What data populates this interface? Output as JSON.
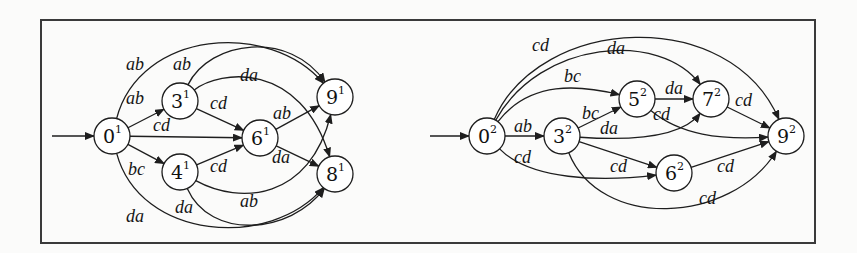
{
  "figure": {
    "frame": {
      "x": 41,
      "y": 20,
      "width": 774,
      "height": 223
    },
    "node_radius": 18,
    "colors": {
      "stroke": "#1e1e1e",
      "frame": "#3a3a3a",
      "background": "#fbfbfa"
    }
  },
  "automata": [
    {
      "id": "automaton-1",
      "initial": {
        "from": [
          52,
          136
        ],
        "to": "0^1"
      },
      "nodes": [
        {
          "id": "0^1",
          "base": "0",
          "sup": "1",
          "x": 112,
          "y": 136
        },
        {
          "id": "3^1",
          "base": "3",
          "sup": "1",
          "x": 180,
          "y": 101
        },
        {
          "id": "4^1",
          "base": "4",
          "sup": "1",
          "x": 180,
          "y": 172
        },
        {
          "id": "6^1",
          "base": "6",
          "sup": "1",
          "x": 260,
          "y": 138
        },
        {
          "id": "9^1",
          "base": "9",
          "sup": "1",
          "x": 335,
          "y": 97
        },
        {
          "id": "8^1",
          "base": "8",
          "sup": "1",
          "x": 335,
          "y": 174
        }
      ],
      "edges": [
        {
          "from": "0^1",
          "to": "9^1",
          "label": "ab",
          "c1": [
            140,
            30
          ],
          "c2": [
            270,
            20
          ],
          "lx": 126,
          "ly": 70
        },
        {
          "from": "0^1",
          "to": "3^1",
          "label": "ab",
          "lx": 126,
          "ly": 104
        },
        {
          "from": "0^1",
          "to": "6^1",
          "label": "cd",
          "lx": 153,
          "ly": 131
        },
        {
          "from": "0^1",
          "to": "4^1",
          "label": "bc",
          "lx": 128,
          "ly": 175
        },
        {
          "from": "0^1",
          "to": "8^1",
          "label": "da",
          "c1": [
            140,
            240
          ],
          "c2": [
            270,
            250
          ],
          "lx": 126,
          "ly": 222
        },
        {
          "from": "3^1",
          "to": "9^1",
          "label": "ab",
          "c1": [
            210,
            40
          ],
          "c2": [
            290,
            30
          ],
          "lx": 173,
          "ly": 70
        },
        {
          "from": "3^1",
          "to": "8^1",
          "label": "da",
          "c1": [
            220,
            70
          ],
          "c2": [
            300,
            60
          ],
          "lx": 240,
          "ly": 81
        },
        {
          "from": "3^1",
          "to": "6^1",
          "label": "cd",
          "lx": 210,
          "ly": 109
        },
        {
          "from": "4^1",
          "to": "6^1",
          "label": "cd",
          "lx": 210,
          "ly": 172
        },
        {
          "from": "4^1",
          "to": "9^1",
          "label": "ab",
          "c1": [
            240,
            205
          ],
          "c2": [
            310,
            200
          ],
          "lx": 240,
          "ly": 207
        },
        {
          "from": "4^1",
          "to": "8^1",
          "label": "da",
          "c1": [
            210,
            240
          ],
          "c2": [
            290,
            235
          ],
          "lx": 175,
          "ly": 213
        },
        {
          "from": "6^1",
          "to": "9^1",
          "label": "ab",
          "lx": 273,
          "ly": 119
        },
        {
          "from": "6^1",
          "to": "8^1",
          "label": "da",
          "lx": 272,
          "ly": 163
        }
      ]
    },
    {
      "id": "automaton-2",
      "initial": {
        "from": [
          430,
          136
        ],
        "to": "0^2"
      },
      "nodes": [
        {
          "id": "0^2",
          "base": "0",
          "sup": "2",
          "x": 487,
          "y": 136
        },
        {
          "id": "3^2",
          "base": "3",
          "sup": "2",
          "x": 562,
          "y": 136
        },
        {
          "id": "5^2",
          "base": "5",
          "sup": "2",
          "x": 637,
          "y": 99
        },
        {
          "id": "7^2",
          "base": "7",
          "sup": "2",
          "x": 711,
          "y": 99
        },
        {
          "id": "6^2",
          "base": "6",
          "sup": "2",
          "x": 674,
          "y": 173
        },
        {
          "id": "9^2",
          "base": "9",
          "sup": "2",
          "x": 786,
          "y": 136
        }
      ],
      "edges": [
        {
          "from": "0^2",
          "to": "9^2",
          "label": "cd",
          "c1": [
            540,
            15
          ],
          "c2": [
            730,
            5
          ],
          "lx": 532,
          "ly": 51
        },
        {
          "from": "0^2",
          "to": "7^2",
          "label": "da",
          "c1": [
            540,
            40
          ],
          "c2": [
            660,
            30
          ],
          "lx": 607,
          "ly": 54
        },
        {
          "from": "0^2",
          "to": "5^2",
          "label": "bc",
          "c1": [
            530,
            80
          ],
          "c2": [
            580,
            85
          ],
          "lx": 564,
          "ly": 82
        },
        {
          "from": "0^2",
          "to": "3^2",
          "label": "ab",
          "lx": 514,
          "ly": 132
        },
        {
          "from": "0^2",
          "to": "6^2",
          "label": "cd",
          "c1": [
            530,
            180
          ],
          "c2": [
            600,
            182
          ],
          "lx": 514,
          "ly": 163
        },
        {
          "from": "3^2",
          "to": "5^2",
          "label": "bc",
          "lx": 582,
          "ly": 119
        },
        {
          "from": "3^2",
          "to": "7^2",
          "label": "da",
          "c1": [
            620,
            140
          ],
          "c2": [
            680,
            140
          ],
          "lx": 600,
          "ly": 134
        },
        {
          "from": "3^2",
          "to": "6^2",
          "label": "cd",
          "lx": 610,
          "ly": 172
        },
        {
          "from": "3^2",
          "to": "9^2",
          "label": "cd",
          "c1": [
            600,
            230
          ],
          "c2": [
            730,
            225
          ],
          "lx": 699,
          "ly": 204
        },
        {
          "from": "5^2",
          "to": "7^2",
          "label": "da",
          "lx": 665,
          "ly": 94
        },
        {
          "from": "5^2",
          "to": "9^2",
          "label": "cd",
          "c1": [
            680,
            135
          ],
          "c2": [
            720,
            140
          ],
          "lx": 653,
          "ly": 120
        },
        {
          "from": "7^2",
          "to": "9^2",
          "label": "cd",
          "lx": 735,
          "ly": 106
        },
        {
          "from": "6^2",
          "to": "9^2",
          "label": "cd",
          "lx": 717,
          "ly": 172
        }
      ]
    }
  ]
}
